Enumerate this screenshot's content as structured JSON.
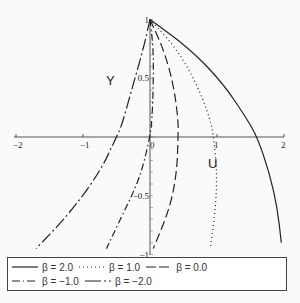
{
  "chart_data": {
    "type": "line",
    "title": "",
    "xlabel": "U",
    "ylabel": "Y",
    "xlim": [
      -2,
      2
    ],
    "ylim": [
      -1,
      1
    ],
    "x_ticks": [
      "−2",
      "−1",
      "0",
      "1",
      "2"
    ],
    "y_ticks": [
      "1",
      "0.5",
      "−0.5",
      "−1"
    ],
    "grid": false,
    "legend_position": "bottom",
    "series": [
      {
        "name": "β = 2.0",
        "style": "solid",
        "points": [
          [
            0,
            1
          ],
          [
            0.6,
            0.75
          ],
          [
            1.1,
            0.45
          ],
          [
            1.45,
            0.15
          ],
          [
            1.6,
            0
          ],
          [
            1.78,
            -0.3
          ],
          [
            1.9,
            -0.6
          ],
          [
            1.96,
            -0.9
          ]
        ]
      },
      {
        "name": "β = 1.0",
        "style": "dotted",
        "points": [
          [
            0,
            1
          ],
          [
            0.4,
            0.75
          ],
          [
            0.7,
            0.45
          ],
          [
            0.9,
            0.15
          ],
          [
            0.95,
            0
          ],
          [
            1.0,
            -0.3
          ],
          [
            0.98,
            -0.6
          ],
          [
            0.9,
            -0.95
          ]
        ]
      },
      {
        "name": "β = 0.0",
        "style": "dashed",
        "points": [
          [
            0,
            1
          ],
          [
            0.2,
            0.75
          ],
          [
            0.35,
            0.45
          ],
          [
            0.42,
            0.15
          ],
          [
            0.42,
            0
          ],
          [
            0.4,
            -0.3
          ],
          [
            0.3,
            -0.6
          ],
          [
            0.05,
            -0.95
          ]
        ]
      },
      {
        "name": "β = −1.0",
        "style": "dash-dot",
        "points": [
          [
            0,
            1
          ],
          [
            0.05,
            0.75
          ],
          [
            0.05,
            0.45
          ],
          [
            0.03,
            0.15
          ],
          [
            0,
            0
          ],
          [
            -0.15,
            -0.35
          ],
          [
            -0.4,
            -0.65
          ],
          [
            -0.65,
            -0.95
          ]
        ]
      },
      {
        "name": "β = −2.0",
        "style": "long-dash",
        "points": [
          [
            0,
            1
          ],
          [
            -0.1,
            0.75
          ],
          [
            -0.25,
            0.45
          ],
          [
            -0.42,
            0.1
          ],
          [
            -0.5,
            0
          ],
          [
            -0.75,
            -0.3
          ],
          [
            -1.2,
            -0.65
          ],
          [
            -1.7,
            -0.95
          ]
        ]
      }
    ]
  },
  "legend": {
    "items": [
      {
        "label": "β = 2.0"
      },
      {
        "label": "β = 1.0"
      },
      {
        "label": "β = 0.0"
      },
      {
        "label": "β = −1.0"
      },
      {
        "label": "β = −2.0"
      }
    ]
  },
  "axes": {
    "x_name": "U",
    "y_name": "Y"
  }
}
